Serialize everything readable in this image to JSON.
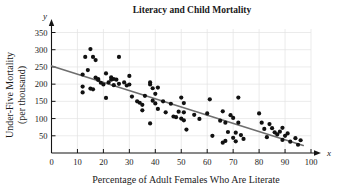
{
  "chart_data": {
    "type": "scatter",
    "title": "Literacy and Child Mortality",
    "xlabel": "Percentage of Adult Females Who Are Literate",
    "ylabel_line1": "Under-Five Mortality",
    "ylabel_line2": "(per thousand)",
    "x_axis_letter": "x",
    "y_axis_letter": "y",
    "xlim": [
      0,
      100
    ],
    "ylim": [
      0,
      370
    ],
    "xticks": [
      0,
      10,
      20,
      30,
      40,
      50,
      60,
      70,
      80,
      90,
      100
    ],
    "yticks": [
      50,
      100,
      150,
      200,
      250,
      300,
      350
    ],
    "grid": true,
    "legend": "none",
    "marker_color": "#111111",
    "fit_line_color": "#6e6e6e",
    "grid_color": "#e3e3e3",
    "axis_color": "#151515",
    "trend_line": {
      "label": "least-squares regression line",
      "x_start": 0,
      "y_start": 253,
      "x_end": 97,
      "y_end": 22
    },
    "points": [
      [
        12,
        228
      ],
      [
        12,
        193
      ],
      [
        12,
        176
      ],
      [
        13,
        279
      ],
      [
        14,
        241
      ],
      [
        15,
        302
      ],
      [
        15,
        187
      ],
      [
        16,
        279
      ],
      [
        16,
        185
      ],
      [
        17,
        270
      ],
      [
        17,
        219
      ],
      [
        18,
        215
      ],
      [
        18,
        212
      ],
      [
        19,
        204
      ],
      [
        20,
        199
      ],
      [
        21,
        231
      ],
      [
        21,
        160
      ],
      [
        22,
        205
      ],
      [
        23,
        220
      ],
      [
        23,
        213
      ],
      [
        24,
        215
      ],
      [
        24,
        197
      ],
      [
        25,
        213
      ],
      [
        26,
        279
      ],
      [
        26,
        201
      ],
      [
        28,
        205
      ],
      [
        29,
        196
      ],
      [
        30,
        224
      ],
      [
        30,
        199
      ],
      [
        31,
        164
      ],
      [
        33,
        150
      ],
      [
        34,
        146
      ],
      [
        35,
        140
      ],
      [
        35,
        124
      ],
      [
        36,
        166
      ],
      [
        38,
        205
      ],
      [
        38,
        199
      ],
      [
        38,
        86
      ],
      [
        39,
        188
      ],
      [
        39,
        152
      ],
      [
        40,
        172
      ],
      [
        40,
        144
      ],
      [
        41,
        190
      ],
      [
        41,
        128
      ],
      [
        43,
        150
      ],
      [
        44,
        118
      ],
      [
        46,
        143
      ],
      [
        47,
        106
      ],
      [
        48,
        104
      ],
      [
        49,
        120
      ],
      [
        50,
        161
      ],
      [
        50,
        100
      ],
      [
        51,
        145
      ],
      [
        51,
        118
      ],
      [
        51,
        95
      ],
      [
        52,
        68
      ],
      [
        55,
        111
      ],
      [
        57,
        99
      ],
      [
        60,
        115
      ],
      [
        61,
        156
      ],
      [
        62,
        50
      ],
      [
        65,
        94
      ],
      [
        66,
        121
      ],
      [
        66,
        30
      ],
      [
        67,
        88
      ],
      [
        67,
        35
      ],
      [
        68,
        61
      ],
      [
        69,
        110
      ],
      [
        70,
        102
      ],
      [
        70,
        44
      ],
      [
        71,
        59
      ],
      [
        71,
        34
      ],
      [
        72,
        161
      ],
      [
        72,
        88
      ],
      [
        73,
        52
      ],
      [
        74,
        41
      ],
      [
        80,
        115
      ],
      [
        81,
        88
      ],
      [
        82,
        70
      ],
      [
        83,
        46
      ],
      [
        84,
        84
      ],
      [
        85,
        72
      ],
      [
        86,
        60
      ],
      [
        87,
        54
      ],
      [
        88,
        62
      ],
      [
        89,
        73
      ],
      [
        89,
        38
      ],
      [
        90,
        50
      ],
      [
        91,
        57
      ],
      [
        92,
        33
      ],
      [
        94,
        43
      ],
      [
        95,
        24
      ],
      [
        96,
        37
      ]
    ]
  }
}
